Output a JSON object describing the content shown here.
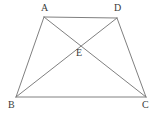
{
  "figure": {
    "kind": "geometry-diagram",
    "shape_name": "trapezoid",
    "canvas": {
      "width": 164,
      "height": 116
    },
    "background_color": "#ffffff",
    "stroke_color": "#808080",
    "label_color": "#3a3a3a",
    "stroke_width": 1,
    "points": {
      "A": {
        "label": "A",
        "x": 44,
        "y": 17,
        "label_x": 41,
        "label_y": 3
      },
      "D": {
        "label": "D",
        "x": 117,
        "y": 18,
        "label_x": 114,
        "label_y": 3
      },
      "B": {
        "label": "B",
        "x": 16,
        "y": 97,
        "label_x": 8,
        "label_y": 100
      },
      "C": {
        "label": "C",
        "x": 146,
        "y": 97,
        "label_x": 142,
        "label_y": 100
      },
      "E": {
        "label": "E",
        "x": 79,
        "y": 47,
        "label_x": 76,
        "label_y": 48
      }
    },
    "segments": [
      {
        "name": "side-AD",
        "from": "A",
        "to": "D"
      },
      {
        "name": "side-AB",
        "from": "A",
        "to": "B"
      },
      {
        "name": "side-DC",
        "from": "D",
        "to": "C"
      },
      {
        "name": "side-BC",
        "from": "B",
        "to": "C"
      },
      {
        "name": "diagonal-AC",
        "from": "A",
        "to": "C"
      },
      {
        "name": "diagonal-BD",
        "from": "B",
        "to": "D"
      }
    ]
  }
}
